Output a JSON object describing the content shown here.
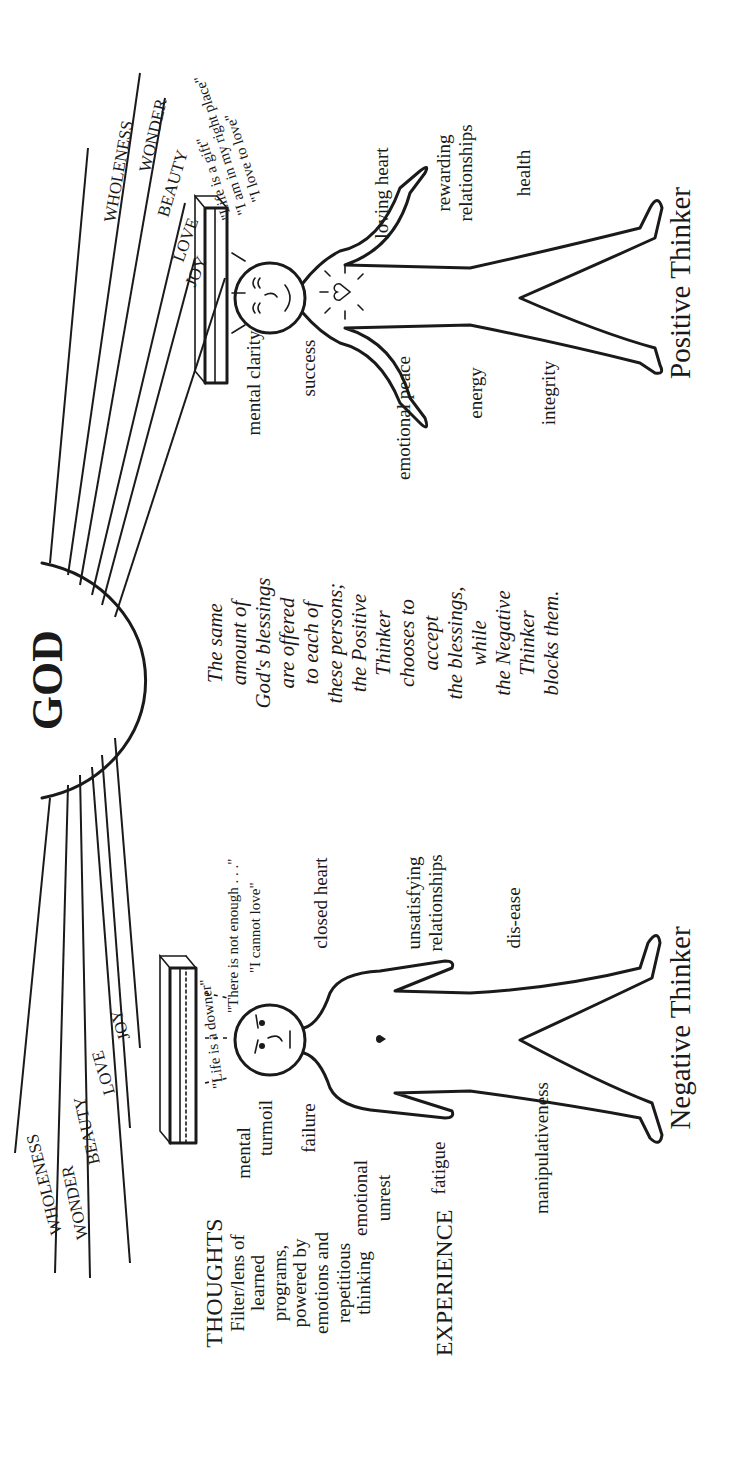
{
  "center": {
    "title": "GOD",
    "caption_lines": [
      "The same",
      "amount of",
      "God's blessings",
      "are offered",
      "to each of",
      "these persons;",
      "the Positive",
      "Thinker",
      "chooses to",
      "accept",
      "the blessings,",
      "while",
      "the Negative",
      "Thinker",
      "blocks them."
    ]
  },
  "legend": {
    "thoughts_heading": "THOUGHTS",
    "thoughts_lines": [
      "Filter/lens of",
      "learned",
      "programs,",
      "powered by",
      "emotions and",
      "repetitious",
      "thinking"
    ],
    "experience_heading": "EXPERIENCE"
  },
  "blessing_rays": [
    "JOY",
    "LOVE",
    "BEAUTY",
    "WONDER",
    "WHOLENESS"
  ],
  "negative_thinker": {
    "label": "Negative Thinker",
    "quotes": [
      "\"Life is a downer\"",
      "\"There is not enough . . .\"",
      "\"I cannot love\""
    ],
    "experiences": {
      "mental_turmoil": [
        "mental",
        "turmoil"
      ],
      "failure": "failure",
      "emotional_unrest": [
        "emotional",
        "unrest"
      ],
      "fatigue": "fatigue",
      "manipulativeness": "manipulativeness",
      "closed_heart": "closed heart",
      "unsatisfying_relationships": [
        "unsatisfying",
        "relationships"
      ],
      "dis_ease": "dis-ease"
    }
  },
  "positive_thinker": {
    "label": "Positive Thinker",
    "quotes": [
      "\"Life is a gift\"",
      "\"I am in my right place\"",
      "\"I love to love\""
    ],
    "experiences": {
      "mental_clarity": "mental clarity",
      "success": "success",
      "emotional_peace": "emotional peace",
      "energy": "energy",
      "integrity": "integrity",
      "loving_heart": "loving heart",
      "rewarding_relationships": [
        "rewarding",
        "relationships"
      ],
      "health": "health"
    }
  },
  "colors": {
    "ink": "#1a1a1a",
    "paper": "#ffffff"
  }
}
